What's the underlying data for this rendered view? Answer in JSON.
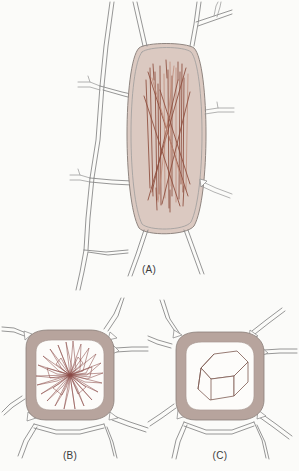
{
  "figure": {
    "background_color": "#fbfbf9",
    "panel_count": 3
  },
  "panels": [
    {
      "id": "A",
      "label": "(A)",
      "crystal_type": "raphides",
      "crystal_description": "bundle of needle-shaped crystals in an elongated cell",
      "cell_shape": "elongated hexagonal",
      "cell_fill_color": "#dbc9c1",
      "crystal_color": "#8d4c3b",
      "wall_color": "#8a8a8a",
      "needle_count": 22
    },
    {
      "id": "B",
      "label": "(B)",
      "crystal_type": "druse",
      "crystal_description": "star-shaped radiating crystal aggregate",
      "cell_shape": "rounded square",
      "wall_band_color": "#b7a49d",
      "lumen_color": "#fdfcfa",
      "crystal_color": "#8a4a45",
      "ray_count": 28
    },
    {
      "id": "C",
      "label": "(C)",
      "crystal_type": "prismatic crystal",
      "crystal_description": "single hexagonal prism crystal",
      "cell_shape": "rounded square",
      "wall_band_color": "#b7a49d",
      "lumen_color": "#fdfcfa",
      "crystal_color": "#7d5a52",
      "face_count": 3
    }
  ]
}
